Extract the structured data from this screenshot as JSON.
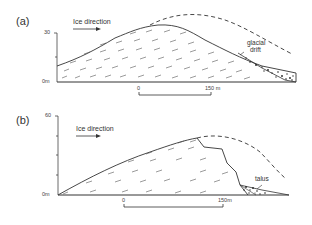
{
  "figure": {
    "panels": [
      {
        "label": "(a)",
        "ice_direction": "Ice direction",
        "y_axis": {
          "top_label": "30",
          "bottom_label": "0m"
        },
        "scale_bar": {
          "start": "0",
          "end": "150 m"
        },
        "annotation": "glacial drift",
        "annotation_line1": "glacial",
        "annotation_line2": "drift"
      },
      {
        "label": "(b)",
        "ice_direction": "Ice direction",
        "y_axis": {
          "top_label": "60",
          "bottom_label": "0m"
        },
        "scale_bar": {
          "start": "0",
          "end": "150m"
        },
        "annotation": "talus"
      }
    ]
  },
  "colors": {
    "line": "#333333",
    "background": "#ffffff"
  }
}
